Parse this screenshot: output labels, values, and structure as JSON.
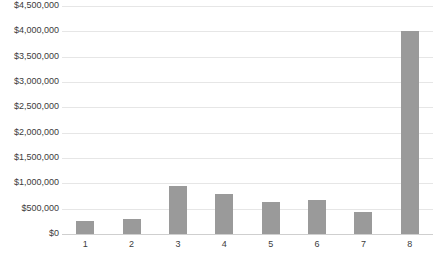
{
  "chart_data": {
    "type": "bar",
    "title": "",
    "xlabel": "",
    "ylabel": "",
    "categories": [
      "1",
      "2",
      "3",
      "4",
      "5",
      "6",
      "7",
      "8"
    ],
    "values": [
      255000,
      295000,
      945000,
      790000,
      630000,
      670000,
      435000,
      4000000
    ],
    "ylim": [
      0,
      4500000
    ],
    "ytick_values": [
      0,
      500000,
      1000000,
      1500000,
      2000000,
      2500000,
      3000000,
      3500000,
      4000000,
      4500000
    ],
    "ytick_labels": [
      "$0",
      "$500,000",
      "$1,000,000",
      "$1,500,000",
      "$2,000,000",
      "$2,500,000",
      "$3,000,000",
      "$3,500,000",
      "$4,000,000",
      "$4,500,000"
    ],
    "grid": true,
    "legend": false,
    "legend_position": "none",
    "bar_color": "#9a9a9a",
    "gridline_color": "#e6e6e6",
    "axis_color": "#cfcfcf",
    "background_color": "#ffffff",
    "tick_label_color": "#3c3c3c"
  }
}
